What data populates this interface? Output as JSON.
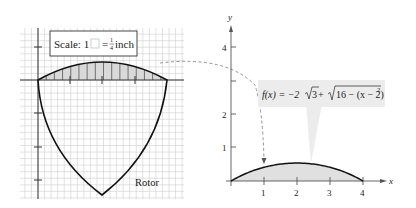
{
  "left_panel": {
    "scale_label_prefix": "Scale: 1",
    "scale_equals": "=",
    "scale_fraction_num": "1",
    "scale_fraction_den": "4",
    "scale_unit": "inch",
    "rotor_label": "Rotor",
    "grid_color": "#c8c8c8",
    "shade_color": "#d9d9d9"
  },
  "right_panel": {
    "x_axis_label": "x",
    "y_axis_label": "y",
    "x_ticks": [
      "1",
      "2",
      "3",
      "4"
    ],
    "y_ticks": [
      "1",
      "2",
      "4"
    ],
    "function_label": {
      "fx": "f(x) = −2",
      "sqrt3": "3",
      "plus": " + ",
      "sqrt_expr": "16 − (x − 2)",
      "exponent": "2"
    },
    "callout_bg": "#ececec",
    "fill_color": "#e0e0e0"
  },
  "chart_data": {
    "type": "area",
    "title": "",
    "function": "f(x) = -2*sqrt(3) + sqrt(16 - (x-2)^2)",
    "xlabel": "x",
    "ylabel": "y",
    "xlim": [
      0,
      4
    ],
    "ylim": [
      0,
      4.5
    ],
    "x_ticks": [
      1,
      2,
      3,
      4
    ],
    "y_ticks": [
      1,
      2,
      4
    ],
    "x": [
      0,
      0.5,
      1,
      1.5,
      2,
      2.5,
      3,
      3.5,
      4
    ],
    "values": [
      0,
      0.24,
      0.41,
      0.5,
      0.54,
      0.5,
      0.41,
      0.24,
      0
    ]
  }
}
